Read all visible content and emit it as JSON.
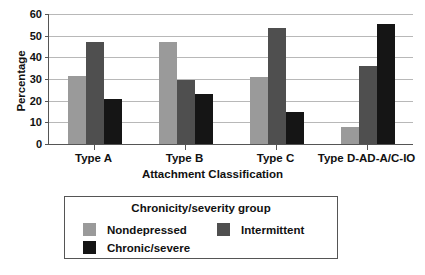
{
  "chart_data": {
    "type": "bar",
    "title": "",
    "xlabel": "Attachment Classification",
    "ylabel": "Percentage",
    "categories": [
      "Type A",
      "Type B",
      "Type C",
      "Type D-AD-A/C-IO"
    ],
    "series": [
      {
        "name": "Nondepressed",
        "color": "#9a9a9a",
        "values": [
          31.5,
          47.0,
          31.0,
          8.0
        ]
      },
      {
        "name": "Intermittent",
        "color": "#4f4f4f",
        "values": [
          47.0,
          29.5,
          53.5,
          36.0
        ]
      },
      {
        "name": "Chronic/severe",
        "color": "#151515",
        "values": [
          21.0,
          23.0,
          15.0,
          55.5
        ]
      }
    ],
    "ylim": [
      0,
      60
    ],
    "yticks": [
      0,
      10,
      20,
      30,
      40,
      50,
      60
    ],
    "ytick_labels": [
      "0",
      "10",
      "20",
      "30",
      "40",
      "50",
      "60"
    ],
    "grid": true,
    "legend_position": "bottom",
    "legend_title": "Chronicity/severity group"
  },
  "axis": {
    "y_title": "Percentage",
    "x_title": "Attachment Classification"
  },
  "legend": {
    "title": "Chronicity/severity group",
    "entries": [
      {
        "label": "Nondepressed"
      },
      {
        "label": "Intermittent"
      },
      {
        "label": "Chronic/severe"
      }
    ]
  }
}
